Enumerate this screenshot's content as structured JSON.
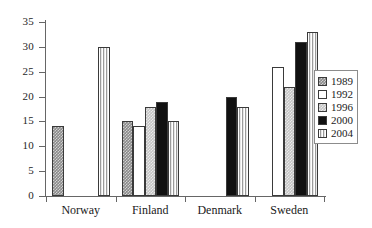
{
  "chart_data": {
    "type": "bar",
    "title": "",
    "subtitle": "",
    "xlabel": "",
    "ylabel": "",
    "categories": [
      "Norway",
      "Finland",
      "Denmark",
      "Sweden"
    ],
    "series": [
      {
        "name": "1989",
        "color": "#8a8a8a",
        "pattern": "checker-dark",
        "values": [
          14,
          15,
          null,
          null
        ]
      },
      {
        "name": "1992",
        "color": "#ffffff",
        "pattern": "solid-white",
        "values": [
          null,
          14,
          null,
          26
        ]
      },
      {
        "name": "1996",
        "color": "#c4c4c4",
        "pattern": "checker-light",
        "values": [
          null,
          18,
          null,
          22
        ]
      },
      {
        "name": "2000",
        "color": "#111111",
        "pattern": "solid-black",
        "values": [
          null,
          19,
          20,
          31
        ]
      },
      {
        "name": "2004",
        "color": "#d8d8d8",
        "pattern": "vertical-stripes",
        "values": [
          30,
          15,
          18,
          33
        ]
      }
    ],
    "ylim": [
      0,
      35
    ],
    "ytick_values": [
      0,
      5,
      10,
      15,
      20,
      25,
      30,
      35
    ],
    "ytick_labels": [
      "0",
      "5",
      "10",
      "15",
      "20",
      "25",
      "30",
      "35"
    ],
    "grid": false,
    "legend_position": "right",
    "legend_entries": [
      "1989",
      "1992",
      "1996",
      "2000",
      "2004"
    ]
  },
  "axis": {
    "y_labels": [
      "35",
      "30",
      "25",
      "20",
      "15",
      "10",
      "5",
      "0"
    ]
  },
  "groups": [
    {
      "label": "Norway"
    },
    {
      "label": "Finland"
    },
    {
      "label": "Denmark"
    },
    {
      "label": "Sweden"
    }
  ],
  "legend": {
    "items": [
      {
        "label": "1989"
      },
      {
        "label": "1992"
      },
      {
        "label": "1996"
      },
      {
        "label": "2000"
      },
      {
        "label": "2004"
      }
    ]
  }
}
